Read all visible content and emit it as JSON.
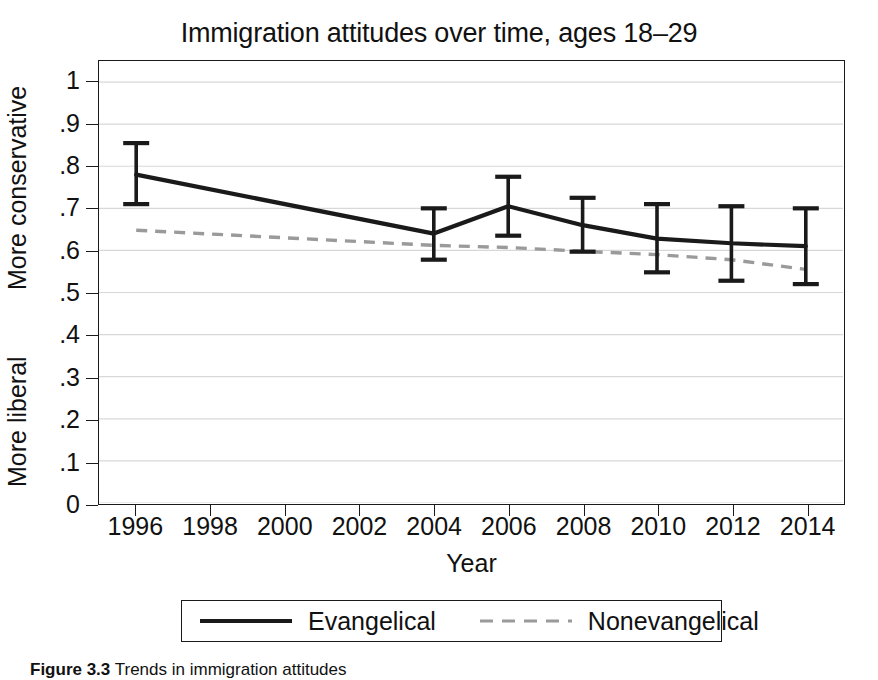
{
  "chart_data": {
    "type": "line",
    "title": "Immigration attitudes over time, ages 18–29",
    "xlabel": "Year",
    "ylabel_top": "More conservative",
    "ylabel_bottom": "More liberal",
    "xlim": [
      1995,
      2015
    ],
    "ylim": [
      0,
      1.05
    ],
    "xticks": [
      1996,
      1998,
      2000,
      2002,
      2004,
      2006,
      2008,
      2010,
      2012,
      2014
    ],
    "xticklabels": [
      "1996",
      "1998",
      "2000",
      "2002",
      "2004",
      "2006",
      "2008",
      "2010",
      "2012",
      "2014"
    ],
    "yticks": [
      0,
      0.1,
      0.2,
      0.3,
      0.4,
      0.5,
      0.6,
      0.7,
      0.8,
      0.9,
      1
    ],
    "yticklabels": [
      "0",
      ".1",
      ".2",
      ".3",
      ".4",
      ".5",
      ".6",
      ".7",
      ".8",
      ".9",
      "1"
    ],
    "grid": true,
    "grid_color": "#d8d8d8",
    "legend_position": "below-axes",
    "series": [
      {
        "name": "Evangelical",
        "style": "solid",
        "color": "#1a1a1a",
        "has_error_bars": true,
        "x": [
          1996,
          2004,
          2006,
          2008,
          2010,
          2012,
          2014
        ],
        "values": [
          0.78,
          0.64,
          0.705,
          0.66,
          0.628,
          0.617,
          0.61
        ],
        "error_low": [
          0.71,
          0.578,
          0.635,
          0.597,
          0.548,
          0.528,
          0.52
        ],
        "error_high": [
          0.855,
          0.7,
          0.775,
          0.725,
          0.71,
          0.705,
          0.7
        ]
      },
      {
        "name": "Nonevangelical",
        "style": "dashed",
        "color": "#9a9a9a",
        "has_error_bars": false,
        "x": [
          1996,
          2004,
          2006,
          2008,
          2010,
          2012,
          2014
        ],
        "values": [
          0.648,
          0.612,
          0.607,
          0.598,
          0.59,
          0.578,
          0.555
        ]
      }
    ]
  },
  "legend": {
    "entries": [
      {
        "label": "Evangelical",
        "style": "solid",
        "color": "#1a1a1a"
      },
      {
        "label": "Nonevangelical",
        "style": "dashed",
        "color": "#9a9a9a"
      }
    ]
  },
  "caption": {
    "label": "Figure 3.3",
    "text": "Trends in immigration attitudes"
  }
}
